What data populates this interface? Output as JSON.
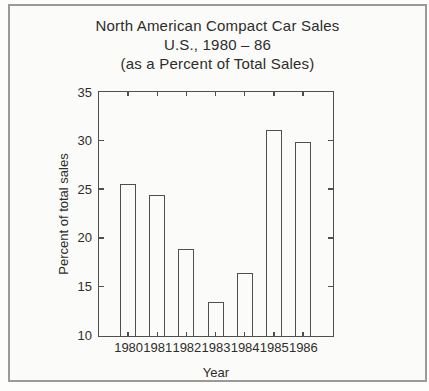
{
  "panel": {
    "background": "#fbfbf9",
    "border_color": "#9a9a98",
    "line_color": "#504f4d",
    "text_color": "#2d2d2b"
  },
  "title": {
    "line1": "North American Compact Car Sales",
    "line2": "U.S., 1980 – 86",
    "line3": "(as a Percent of Total Sales)"
  },
  "chart_data": {
    "type": "bar",
    "categories": [
      "1980",
      "1981",
      "1982",
      "1983",
      "1984",
      "1985",
      "1986"
    ],
    "values": [
      25.6,
      24.5,
      19.0,
      13.5,
      16.5,
      31.2,
      30.0
    ],
    "title": "North American Compact Car Sales U.S., 1980 – 86 (as a Percent of Total Sales)",
    "xlabel": "Year",
    "ylabel": "Percent of total sales",
    "ylim": [
      10,
      35
    ],
    "yticks": [
      10,
      15,
      20,
      25,
      30,
      35
    ],
    "grid": false,
    "legend": false,
    "bar_style": "outlined-unfilled",
    "axis_style": "box-with-inward-ticks"
  }
}
